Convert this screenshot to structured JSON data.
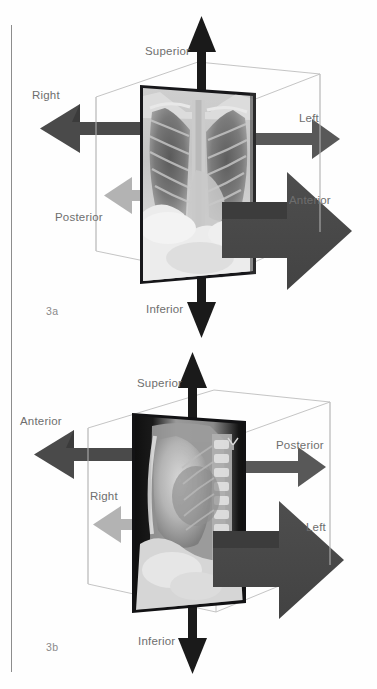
{
  "figure": {
    "background_color": "#fefefe",
    "label_color": "#6e6e6e",
    "fignum_color": "#8a8a8a",
    "cube_line_color": "#b9b9b9",
    "arrow_colors": {
      "vertical_black": "#1a1a1a",
      "dark_gray": "#4a4a4a",
      "mid_gray": "#565656",
      "light_gray": "#b0b0b0"
    }
  },
  "panels": [
    {
      "id": "3a",
      "fignum": "3a",
      "view": "frontal-chest-xray",
      "labels": {
        "up": "Superior",
        "down": "Inferior",
        "left_upper": "Right",
        "right_upper": "Left",
        "left_lower": "Posterior",
        "right_lower": "Anterior"
      }
    },
    {
      "id": "3b",
      "fignum": "3b",
      "view": "lateral-chest-xray",
      "labels": {
        "up": "Superior",
        "down": "Inferior",
        "left_upper": "Anterior",
        "right_upper": "Posterior",
        "left_lower": "Right",
        "right_lower": "Left"
      }
    }
  ]
}
